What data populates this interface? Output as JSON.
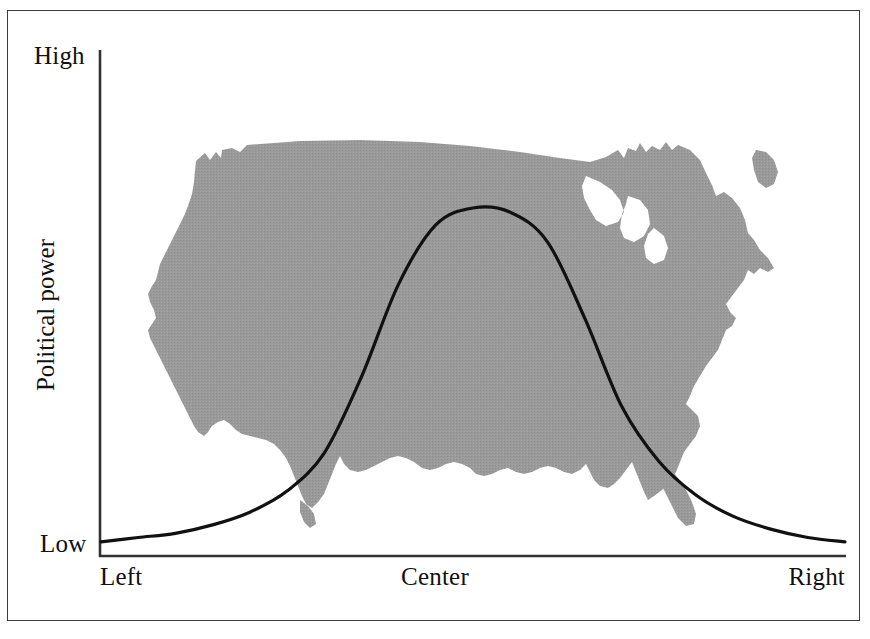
{
  "figure": {
    "background_color": "#ffffff",
    "frame_color": "#3d3d3d",
    "map_fill_color": "#969696",
    "curve_color": "#111111",
    "axis_color": "#333333",
    "map_icon_name": "united-states-map-silhouette"
  },
  "axes": {
    "y_label": "Political power",
    "y_tick_high": "High",
    "y_tick_low": "Low",
    "x_tick_left": "Left",
    "x_tick_center": "Center",
    "x_tick_right": "Right"
  },
  "chart_data": {
    "type": "line",
    "title": "",
    "xlabel": "",
    "ylabel": "Political power",
    "xlim": [
      0,
      100
    ],
    "ylim": [
      0,
      100
    ],
    "xtick_labels": [
      "Left",
      "Center",
      "Right"
    ],
    "xtick_positions": [
      0,
      50,
      100
    ],
    "ytick_labels": [
      "Low",
      "High"
    ],
    "ytick_positions": [
      0,
      100
    ],
    "grid": false,
    "legend": "none",
    "annotation": "Bell-shaped distribution of political power overlaid on a gray silhouette map of the contiguous United States",
    "series": [
      {
        "name": "Political power distribution",
        "x": [
          0,
          5,
          10,
          15,
          20,
          25,
          30,
          35,
          40,
          45,
          50,
          55,
          60,
          65,
          70,
          75,
          80,
          85,
          90,
          95,
          100
        ],
        "y": [
          1,
          2,
          3,
          5,
          8,
          13,
          22,
          40,
          62,
          76,
          80,
          79,
          72,
          54,
          33,
          20,
          12,
          7,
          4,
          2,
          1
        ]
      }
    ]
  }
}
